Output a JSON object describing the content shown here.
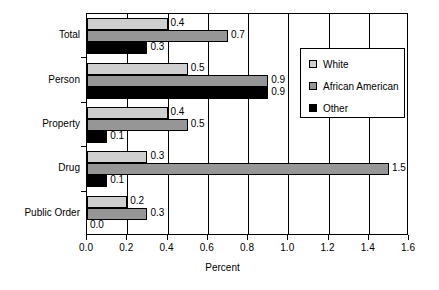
{
  "chart_data": {
    "type": "bar",
    "orientation": "horizontal",
    "title": "",
    "xlabel": "Percent",
    "ylabel": "",
    "xlim": [
      0.0,
      1.6
    ],
    "xticks": [
      "0.0",
      "0.2",
      "0.4",
      "0.6",
      "0.8",
      "1.0",
      "1.2",
      "1.4",
      "1.6"
    ],
    "grid": true,
    "legend_position": "upper right",
    "categories": [
      "Total",
      "Person",
      "Property",
      "Drug",
      "Public Order"
    ],
    "series": [
      {
        "name": "White",
        "color": "#cfcfcf",
        "values": [
          0.4,
          0.5,
          0.4,
          0.3,
          0.2
        ],
        "labels": [
          "0.4",
          "0.5",
          "0.4",
          "0.3",
          "0.2"
        ]
      },
      {
        "name": "African American",
        "color": "#969696",
        "values": [
          0.7,
          0.9,
          0.5,
          1.5,
          0.3
        ],
        "labels": [
          "0.7",
          "0.9",
          "0.5",
          "1.5",
          "0.3"
        ]
      },
      {
        "name": "Other",
        "color": "#000000",
        "values": [
          0.3,
          0.9,
          0.1,
          0.1,
          0.0
        ],
        "labels": [
          "0.3",
          "0.9",
          "0.1",
          "0.1",
          "0.0"
        ]
      }
    ]
  },
  "axis": {
    "xlabel": "Percent",
    "ticks": [
      {
        "value": "0.0"
      },
      {
        "value": "0.2"
      },
      {
        "value": "0.4"
      },
      {
        "value": "0.6"
      },
      {
        "value": "0.8"
      },
      {
        "value": "1.0"
      },
      {
        "value": "1.2"
      },
      {
        "value": "1.4"
      },
      {
        "value": "1.6"
      }
    ]
  },
  "categories": [
    {
      "label": "Total"
    },
    {
      "label": "Person"
    },
    {
      "label": "Property"
    },
    {
      "label": "Drug"
    },
    {
      "label": "Public Order"
    }
  ],
  "legend": {
    "items": [
      {
        "label": "White",
        "color": "#cfcfcf"
      },
      {
        "label": "African American",
        "color": "#969696"
      },
      {
        "label": "Other",
        "color": "#000000"
      }
    ]
  }
}
